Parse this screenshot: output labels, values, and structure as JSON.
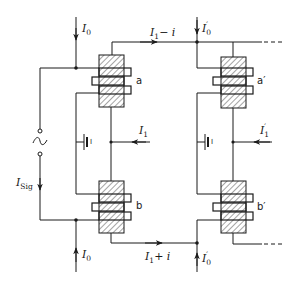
{
  "diagram": {
    "colors": {
      "ink": "#1a1a1a",
      "background": "#ffffff"
    },
    "labels": {
      "I0_top": {
        "main": "I",
        "sub": "0"
      },
      "I0_bottom": {
        "main": "I",
        "sub": "0"
      },
      "I0p_top": {
        "main": "I",
        "sub": "0",
        "prime": "′"
      },
      "I0p_bottom": {
        "main": "I",
        "sub": "0",
        "prime": "′"
      },
      "I1_left": {
        "main": "I",
        "sub": "1"
      },
      "I1_right": {
        "main": "I",
        "sub": "1",
        "prime": "′"
      },
      "I1_minus_i": {
        "main": "I",
        "sub": "1",
        "suffix": "− i"
      },
      "I1_plus_i": {
        "main": "I",
        "sub": "1",
        "suffix": "+ i"
      },
      "Isig": {
        "main": "I",
        "sub": "Sig"
      }
    },
    "cores": [
      {
        "id": "a",
        "label": "a"
      },
      {
        "id": "b",
        "label": "b"
      },
      {
        "id": "a_prime",
        "label": "a′"
      },
      {
        "id": "b_prime",
        "label": "b′"
      }
    ],
    "batteries": [
      {
        "id": "left",
        "label": "I"
      },
      {
        "id": "right",
        "label": "I"
      }
    ],
    "source": {
      "symbol": "~",
      "type": "ac-signal-source"
    }
  }
}
